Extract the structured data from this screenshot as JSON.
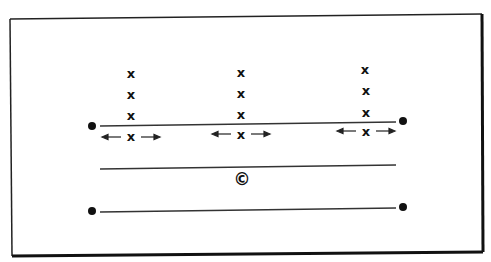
{
  "diagram": {
    "type": "play-diagram",
    "frame": {
      "border_color": "#222222"
    },
    "player_marker": "x",
    "center_marker": "©",
    "columns": [
      {
        "name": "left",
        "x": 131,
        "players": [
          {
            "label": "x",
            "y": 74
          },
          {
            "label": "x",
            "y": 95
          },
          {
            "label": "x",
            "y": 116
          },
          {
            "label": "x",
            "y": 137,
            "arrows": "both"
          }
        ]
      },
      {
        "name": "middle",
        "x": 241,
        "players": [
          {
            "label": "x",
            "y": 73
          },
          {
            "label": "x",
            "y": 94
          },
          {
            "label": "x",
            "y": 115
          },
          {
            "label": "x",
            "y": 135,
            "arrows": "both"
          }
        ]
      },
      {
        "name": "right",
        "x": 366,
        "players": [
          {
            "label": "x",
            "y": 70
          },
          {
            "label": "x",
            "y": 91
          },
          {
            "label": "x",
            "y": 113
          },
          {
            "label": "x",
            "y": 132,
            "arrows": "both"
          }
        ]
      }
    ],
    "center": {
      "label": "©",
      "x": 242,
      "y": 180
    }
  }
}
